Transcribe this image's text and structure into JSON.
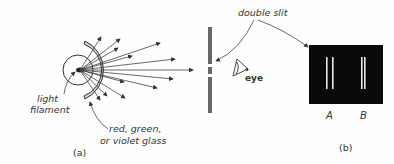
{
  "figure": {
    "panel_a": {
      "caption": "(a)",
      "labels": {
        "filament_line1": "light",
        "filament_line2": "filament",
        "glass_line1": "red, green,",
        "glass_line2": "or violet glass"
      }
    },
    "panel_b": {
      "caption": "(b)",
      "labels": {
        "double_slit": "double slit",
        "eye": "eye",
        "fringe_a": "A",
        "fringe_b": "B"
      }
    },
    "colors": {
      "ink": "#333333",
      "barrier": "#666666",
      "glass_fill": "#d0d0d0",
      "screen": "#0a0a0a",
      "fringe": "#e8e8e8"
    }
  }
}
